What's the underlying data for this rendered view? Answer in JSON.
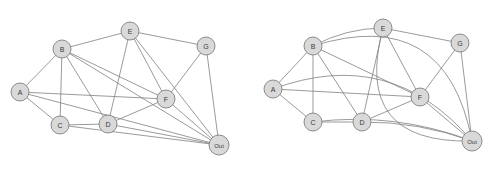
{
  "figure": {
    "background_color": "#ffffff",
    "node_fill_color": "#d9d9d9",
    "node_stroke_color": "#808080",
    "edge_color": "#808080",
    "label_color": "#3a3a3a"
  },
  "graph": {
    "node_ids": [
      "A",
      "B",
      "C",
      "D",
      "E",
      "F",
      "G",
      "Out"
    ],
    "node_labels": {
      "A": "A",
      "B": "B",
      "C": "C",
      "D": "D",
      "E": "E",
      "F": "F",
      "G": "G",
      "Out": "Out"
    },
    "edges": [
      [
        "A",
        "B"
      ],
      [
        "A",
        "C"
      ],
      [
        "A",
        "F"
      ],
      [
        "A",
        "Out"
      ],
      [
        "B",
        "C"
      ],
      [
        "B",
        "D"
      ],
      [
        "B",
        "E"
      ],
      [
        "B",
        "F"
      ],
      [
        "B",
        "Out"
      ],
      [
        "C",
        "D"
      ],
      [
        "C",
        "Out"
      ],
      [
        "D",
        "E"
      ],
      [
        "D",
        "F"
      ],
      [
        "D",
        "Out"
      ],
      [
        "E",
        "F"
      ],
      [
        "E",
        "G"
      ],
      [
        "E",
        "Out"
      ],
      [
        "F",
        "Out"
      ],
      [
        "G",
        "F"
      ],
      [
        "G",
        "Out"
      ]
    ],
    "edge_count": 20,
    "node_count": 8
  },
  "panels": [
    {
      "id": "left",
      "name": "straight-edge-drawing",
      "nodes": [
        {
          "id": "A",
          "label": "A",
          "x": 20,
          "y": 92,
          "r": 9
        },
        {
          "id": "B",
          "label": "B",
          "x": 62,
          "y": 49,
          "r": 9
        },
        {
          "id": "C",
          "label": "C",
          "x": 60,
          "y": 125,
          "r": 9
        },
        {
          "id": "D",
          "label": "D",
          "x": 108,
          "y": 124,
          "r": 9
        },
        {
          "id": "E",
          "label": "E",
          "x": 130,
          "y": 31,
          "r": 9
        },
        {
          "id": "F",
          "label": "F",
          "x": 166,
          "y": 99,
          "r": 9
        },
        {
          "id": "G",
          "label": "G",
          "x": 206,
          "y": 46,
          "r": 9
        },
        {
          "id": "Out",
          "label": "Out",
          "x": 219,
          "y": 145,
          "r": 10
        }
      ]
    },
    {
      "id": "right",
      "name": "planar-embedding-drawing",
      "nodes": [
        {
          "id": "A",
          "label": "A",
          "x": 273,
          "y": 89,
          "r": 9
        },
        {
          "id": "B",
          "label": "B",
          "x": 313,
          "y": 46,
          "r": 9
        },
        {
          "id": "C",
          "label": "C",
          "x": 313,
          "y": 122,
          "r": 9
        },
        {
          "id": "D",
          "label": "D",
          "x": 362,
          "y": 122,
          "r": 9
        },
        {
          "id": "E",
          "label": "E",
          "x": 383,
          "y": 28,
          "r": 9
        },
        {
          "id": "F",
          "label": "F",
          "x": 420,
          "y": 97,
          "r": 9
        },
        {
          "id": "G",
          "label": "G",
          "x": 460,
          "y": 43,
          "r": 9
        },
        {
          "id": "Out",
          "label": "Out",
          "x": 472,
          "y": 141,
          "r": 10
        }
      ]
    }
  ]
}
